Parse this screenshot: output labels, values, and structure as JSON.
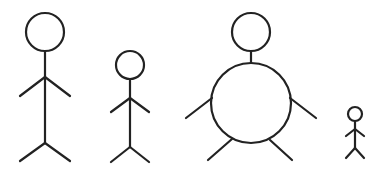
{
  "diagram": {
    "type": "stick-figures",
    "background": "#ffffff",
    "stroke_color": "#222222",
    "figures": [
      {
        "name": "tall-figure",
        "head": {
          "cx": 45,
          "cy": 32,
          "r": 19
        },
        "body": {
          "x1": 45,
          "y1": 51,
          "x2": 45,
          "y2": 143
        },
        "arms": [
          {
            "x1": 45,
            "y1": 77,
            "x2": 20,
            "y2": 96
          },
          {
            "x1": 45,
            "y1": 77,
            "x2": 70,
            "y2": 96
          }
        ],
        "legs": [
          {
            "x1": 45,
            "y1": 143,
            "x2": 20,
            "y2": 161
          },
          {
            "x1": 45,
            "y1": 143,
            "x2": 70,
            "y2": 161
          }
        ]
      },
      {
        "name": "medium-figure",
        "head": {
          "cx": 130,
          "cy": 65,
          "r": 14
        },
        "body": {
          "x1": 130,
          "y1": 79,
          "x2": 130,
          "y2": 147
        },
        "arms": [
          {
            "x1": 130,
            "y1": 98,
            "x2": 111,
            "y2": 112
          },
          {
            "x1": 130,
            "y1": 98,
            "x2": 149,
            "y2": 112
          }
        ],
        "legs": [
          {
            "x1": 130,
            "y1": 147,
            "x2": 111,
            "y2": 162
          },
          {
            "x1": 130,
            "y1": 147,
            "x2": 149,
            "y2": 162
          }
        ]
      },
      {
        "name": "round-figure",
        "head": {
          "cx": 251,
          "cy": 32,
          "r": 19
        },
        "neck": {
          "x1": 251,
          "y1": 51,
          "x2": 251,
          "y2": 63
        },
        "torso": {
          "cx": 251,
          "cy": 103,
          "r": 40
        },
        "arms": [
          {
            "x1": 212,
            "y1": 98,
            "x2": 186,
            "y2": 118
          },
          {
            "x1": 290,
            "y1": 98,
            "x2": 316,
            "y2": 118
          }
        ],
        "legs": [
          {
            "x1": 232,
            "y1": 139,
            "x2": 208,
            "y2": 160
          },
          {
            "x1": 270,
            "y1": 140,
            "x2": 292,
            "y2": 160
          }
        ]
      },
      {
        "name": "small-figure",
        "head": {
          "cx": 355,
          "cy": 114,
          "r": 7
        },
        "body": {
          "x1": 355,
          "y1": 121,
          "x2": 355,
          "y2": 148
        },
        "arms": [
          {
            "x1": 355,
            "y1": 129,
            "x2": 346,
            "y2": 136
          },
          {
            "x1": 355,
            "y1": 129,
            "x2": 364,
            "y2": 136
          }
        ],
        "legs": [
          {
            "x1": 355,
            "y1": 148,
            "x2": 346,
            "y2": 158
          },
          {
            "x1": 355,
            "y1": 148,
            "x2": 364,
            "y2": 158
          }
        ]
      }
    ]
  }
}
